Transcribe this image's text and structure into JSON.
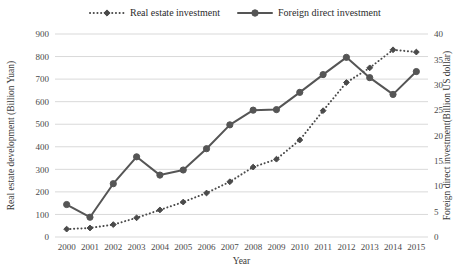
{
  "chart_data": {
    "type": "line",
    "title": "",
    "xlabel": "Year",
    "ylabel": "Real estate development (Billion Yuan)",
    "y2label": "Foreign direct investment(Billion US dollar)",
    "categories": [
      "2000",
      "2001",
      "2002",
      "2003",
      "2004",
      "2005",
      "2006",
      "2007",
      "2008",
      "2009",
      "2010",
      "2011",
      "2012",
      "2013",
      "2014",
      "2015"
    ],
    "ylim": [
      0,
      900
    ],
    "y2lim": [
      0,
      40
    ],
    "yticks": [
      0,
      100,
      200,
      300,
      400,
      500,
      600,
      700,
      800,
      900
    ],
    "y2ticks": [
      0,
      5,
      10,
      15,
      20,
      25,
      30,
      35,
      40
    ],
    "grid": true,
    "legend_position": "top",
    "series": [
      {
        "name": "Real estate investment",
        "axis": "left",
        "line_style": "dotted",
        "marker": "diamond",
        "color": "#4a4a4a",
        "values": [
          35,
          40,
          55,
          85,
          120,
          155,
          195,
          245,
          310,
          345,
          430,
          560,
          685,
          750,
          830,
          820
        ]
      },
      {
        "name": "Foreign direct investment",
        "axis": "right",
        "line_style": "solid",
        "marker": "circle",
        "color": "#555555",
        "values": [
          6.4,
          3.9,
          10.5,
          15.8,
          12.2,
          13.2,
          17.4,
          22.1,
          25.0,
          25.1,
          28.5,
          32.0,
          35.4,
          31.4,
          28.1,
          32.6
        ]
      }
    ]
  },
  "colors": {
    "grid": "#d9d9d9",
    "axis": "#7f7f7f",
    "text": "#2b2b2b",
    "series1": "#4a4a4a",
    "series2": "#555555"
  }
}
